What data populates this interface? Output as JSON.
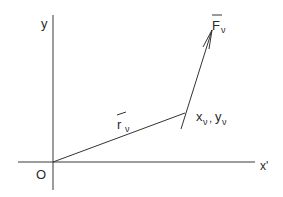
{
  "diagram": {
    "type": "vector-diagram",
    "axes": {
      "y_label": "y",
      "x_label": "x'",
      "origin_label": "O"
    },
    "position_vector": {
      "symbol": "r",
      "subscript": "ν",
      "from": [
        53,
        162
      ],
      "to": [
        185,
        113
      ]
    },
    "point": {
      "label_x": "x",
      "label_y": "y",
      "subscript": "ν",
      "separator": ","
    },
    "force_vector": {
      "symbol": "F",
      "subscript": "ν",
      "from": [
        181,
        129
      ],
      "to": [
        212,
        30
      ]
    },
    "colors": {
      "line": "#333333",
      "text": "#2a2a2a",
      "background": "#ffffff"
    }
  }
}
